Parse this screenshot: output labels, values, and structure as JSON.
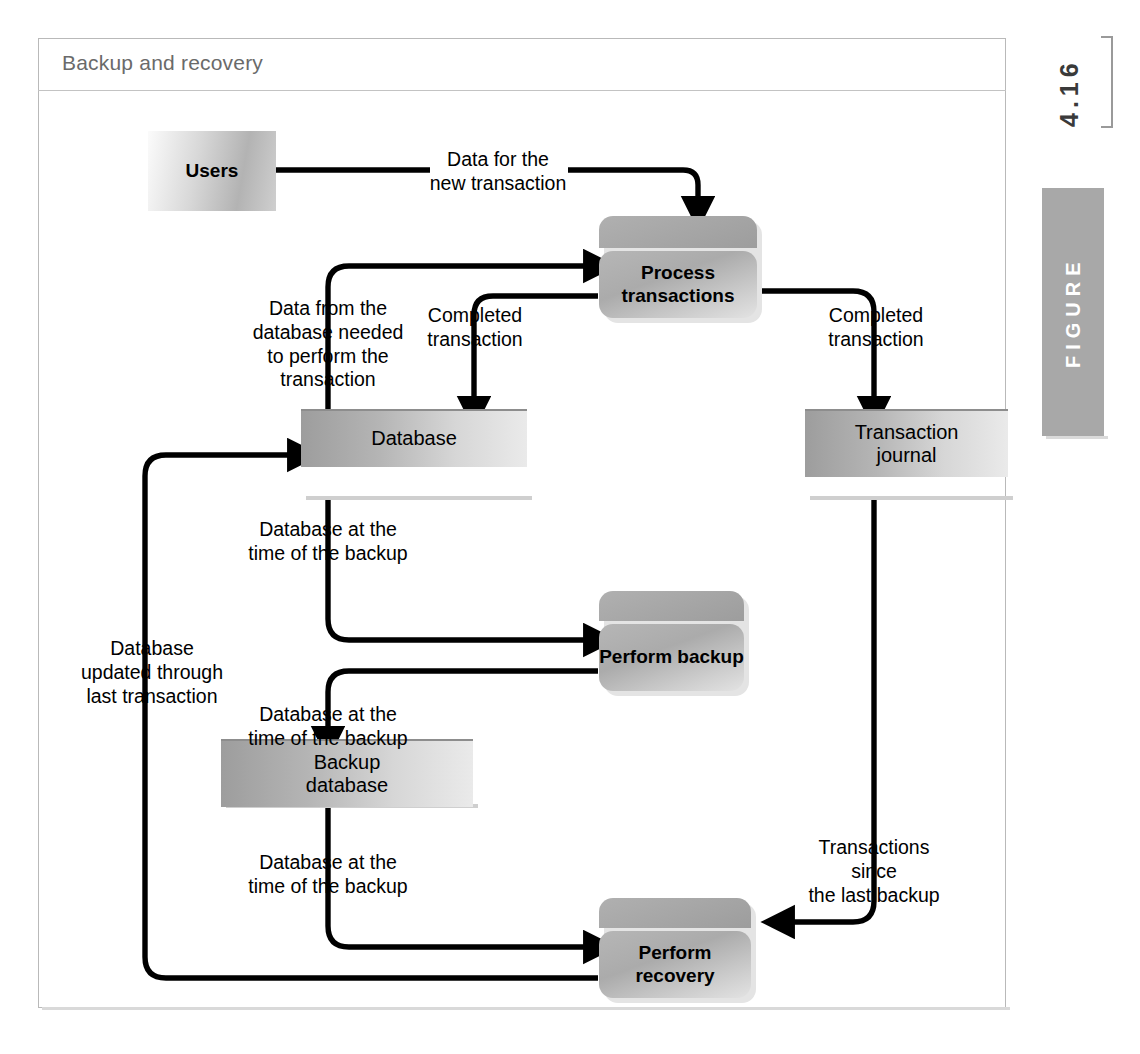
{
  "figure": {
    "title": "Backup and recovery",
    "number": "4.16",
    "tab_label": "FIGURE"
  },
  "nodes": {
    "users": {
      "label": "Users",
      "type": "external-entity"
    },
    "process_transactions": {
      "label": "Process\ntransactions",
      "type": "process"
    },
    "database": {
      "label": "Database",
      "type": "data-store"
    },
    "transaction_journal": {
      "label": "Transaction\njournal",
      "type": "data-store"
    },
    "perform_backup": {
      "label": "Perform\nbackup",
      "type": "process"
    },
    "backup_database": {
      "label": "Backup\ndatabase",
      "type": "data-store"
    },
    "perform_recovery": {
      "label": "Perform\nrecovery",
      "type": "process"
    }
  },
  "flows": {
    "data_for_new_transaction": "Data for the\nnew transaction",
    "data_from_database_needed": "Data from the\ndatabase needed\nto perform the\ntransaction",
    "completed_transaction_db": "Completed\ntransaction",
    "completed_transaction_journal": "Completed\ntransaction",
    "database_at_backup_time_1": "Database at the\ntime of the backup",
    "database_at_backup_time_2": "Database at the\ntime of the backup",
    "database_at_backup_time_3": "Database at the\ntime of the backup",
    "database_updated_through_last": "Database\nupdated through\nlast transaction",
    "transactions_since_last_backup": "Transactions since\nthe last backup"
  },
  "colors": {
    "frame_border": "#b9b9b9",
    "title_text": "#6a6a6a",
    "tab_background": "#a8a8a8",
    "line": "#000000"
  }
}
